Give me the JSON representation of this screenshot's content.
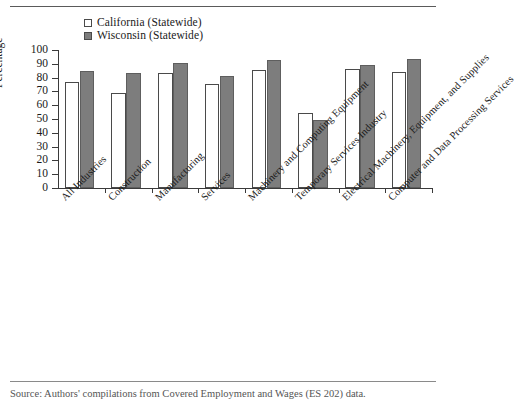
{
  "chart_data": {
    "type": "bar",
    "title": "",
    "xlabel": "",
    "ylabel": "Percentage",
    "ylim": [
      0,
      100
    ],
    "ytick_step": 10,
    "yticks": [
      0,
      10,
      20,
      30,
      40,
      50,
      60,
      70,
      80,
      90,
      100
    ],
    "grid": false,
    "legend_position": "top-left",
    "categories": [
      "All Industries",
      "Construction",
      "Manufacturing",
      "Services",
      "Machinery and Computing Equipment",
      "Temporary Services Industry",
      "Electrical Machinery, Equipment, and Supplies",
      "Computer and Data Processing Services"
    ],
    "series": [
      {
        "name": "California (Statewide)",
        "color": "#ffffff",
        "values": [
          77,
          69,
          83,
          75.5,
          85.5,
          54,
          86.5,
          84
        ]
      },
      {
        "name": "Wisconsin (Statewide)",
        "color": "#7d7d7d",
        "values": [
          84.5,
          83,
          90.5,
          81,
          93,
          49.5,
          89.5,
          93.5
        ]
      }
    ]
  },
  "legend": {
    "items": [
      {
        "label": "California (Statewide)",
        "swatch": "open"
      },
      {
        "label": "Wisconsin (Statewide)",
        "swatch": "filled"
      }
    ]
  },
  "axis": {
    "y_title": "Percentage"
  },
  "source": {
    "note": "Source: Authors' compilations from Covered Employment and Wages (ES 202) data."
  }
}
